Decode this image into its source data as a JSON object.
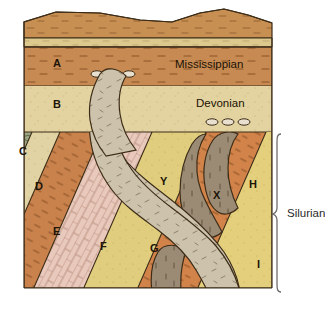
{
  "diagram": {
    "period_labels": [
      {
        "id": "mississippian",
        "text": "Mississippian",
        "x": 175,
        "y": 68
      },
      {
        "id": "devonian",
        "text": "Devonian",
        "x": 196,
        "y": 107
      },
      {
        "id": "silurian",
        "text": "Silurian",
        "x": 287,
        "y": 217
      }
    ],
    "unit_labels": [
      {
        "id": "A",
        "text": "A",
        "x": 53,
        "y": 67,
        "unit": "sandstone"
      },
      {
        "id": "B",
        "text": "B",
        "x": 53,
        "y": 108,
        "unit": "sandstone"
      },
      {
        "id": "C",
        "text": "C",
        "x": 19,
        "y": 155,
        "unit": "conglomerate"
      },
      {
        "id": "D",
        "text": "D",
        "x": 35,
        "y": 190,
        "unit": "siltstone"
      },
      {
        "id": "E",
        "text": "E",
        "x": 53,
        "y": 235,
        "unit": "sandstone"
      },
      {
        "id": "F",
        "text": "F",
        "x": 100,
        "y": 250,
        "unit": "limestone"
      },
      {
        "id": "G",
        "text": "G",
        "x": 150,
        "y": 252,
        "unit": "sandstone"
      },
      {
        "id": "H",
        "text": "H",
        "x": 249,
        "y": 188,
        "unit": "sandstone"
      },
      {
        "id": "I",
        "text": "I",
        "x": 257,
        "y": 268,
        "unit": "sandstone"
      },
      {
        "id": "X",
        "text": "X",
        "x": 213,
        "y": 199,
        "unit": "intrusion"
      },
      {
        "id": "Y",
        "text": "Y",
        "x": 160,
        "y": 185,
        "unit": "intrusion"
      }
    ],
    "colors": {
      "surface_top": "#C88F53",
      "surface_band": "#DCC98E",
      "layer_a": "#C68A52",
      "layer_b": "#E3D3A0",
      "layer_c": "#9BA583",
      "layer_d": "#E2D3A5",
      "layer_e": "#C9824C",
      "layer_f": "#E9C9BC",
      "layer_g": "#E0CE7E",
      "layer_h": "#D2834A",
      "layer_i": "#E4D07C",
      "dike_x": "#9B8B74",
      "dike_y": "#CDC2AC",
      "outline": "#3d2d18",
      "bracket": "#6e6e6e"
    }
  }
}
